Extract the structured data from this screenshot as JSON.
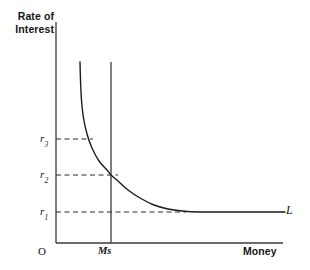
{
  "chart_data": {
    "type": "line",
    "title": "",
    "xlabel": "Money",
    "ylabel": "Rate of Interest",
    "origin_label": "O",
    "grid": false,
    "legend_position": "inline-right",
    "y_tick_labels": [
      "r3",
      "r2",
      "r1"
    ],
    "y_ticks": [
      {
        "label_base": "r",
        "label_sub": "3",
        "value": 3,
        "pixel_y": 139
      },
      {
        "label_base": "r",
        "label_sub": "2",
        "value": 2,
        "pixel_y": 175
      },
      {
        "label_base": "r",
        "label_sub": "1",
        "value": 1,
        "pixel_y": 212
      }
    ],
    "x_tick_labels": [
      "Ms"
    ],
    "x_ticks": [
      {
        "label": "Ms",
        "pixel_x": 111
      }
    ],
    "series": [
      {
        "name": "L",
        "annotation": "L",
        "description": "Liquidity preference curve, rectangular-hyperbola shape becoming horizontal at r1 (liquidity trap)",
        "points": [
          [
            80,
            62
          ],
          [
            80.5,
            80
          ],
          [
            81.5,
            100
          ],
          [
            83.5,
            118
          ],
          [
            87,
            134
          ],
          [
            92,
            148
          ],
          [
            99,
            161
          ],
          [
            107,
            170
          ],
          [
            111,
            175
          ],
          [
            118,
            181
          ],
          [
            128,
            190
          ],
          [
            140,
            198
          ],
          [
            154,
            205
          ],
          [
            168,
            209
          ],
          [
            182,
            211
          ],
          [
            200,
            212
          ],
          [
            230,
            212
          ],
          [
            260,
            212
          ],
          [
            285,
            212
          ]
        ]
      },
      {
        "name": "Ms",
        "annotation": "Ms",
        "description": "Vertical money supply line, perfectly inelastic",
        "points": [
          [
            111,
            62
          ],
          [
            111,
            243
          ]
        ]
      }
    ],
    "equilibrium": {
      "x_label": "Ms",
      "y_label": "r2",
      "pixel": [
        111,
        175
      ]
    },
    "dashed_guides": [
      {
        "from_y_label": "r3",
        "pixel_y": 139,
        "x_start": 56,
        "x_end": 93
      },
      {
        "from_y_label": "r2",
        "pixel_y": 175,
        "x_start": 56,
        "x_end": 118
      },
      {
        "from_y_label": "r1",
        "pixel_y": 212,
        "x_start": 56,
        "x_end": 186
      }
    ],
    "axes": {
      "y_axis_pixel_x": 56,
      "x_axis_pixel_y": 243,
      "x_axis_end_pixel": 283,
      "y_axis_top_pixel": 22
    },
    "colors": {
      "line": "#1a1a1a",
      "axis": "#3a3a3a",
      "dash": "#2b2b2b",
      "background": "#ffffff"
    }
  }
}
